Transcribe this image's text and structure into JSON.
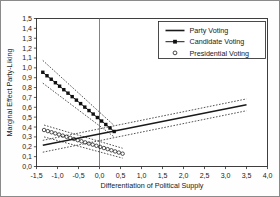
{
  "figure": {
    "caption_fragment": "",
    "frame": true
  },
  "chart_data": {
    "type": "line",
    "title": "",
    "xlabel": "Differentiation of Political Supply",
    "ylabel": "Marginal Effect Party-Liking",
    "xlim": [
      -1.5,
      4.0
    ],
    "ylim": [
      0.0,
      1.5
    ],
    "xticks": [
      -1.5,
      -1.0,
      -0.5,
      0.0,
      0.5,
      1.0,
      1.5,
      2.0,
      2.5,
      3.0,
      3.5,
      4.0
    ],
    "xtick_labels": [
      "-1,5",
      "-1,0",
      "-0,5",
      "0,0",
      "0,5",
      "1,0",
      "1,5",
      "2,0",
      "2,5",
      "3,0",
      "3,5",
      "4,0"
    ],
    "yticks": [
      0.0,
      0.1,
      0.2,
      0.3,
      0.4,
      0.5,
      0.6,
      0.7,
      0.8,
      0.9,
      1.0,
      1.1,
      1.2,
      1.3,
      1.4,
      1.5
    ],
    "ytick_labels": [
      "0,0",
      "0,1",
      "0,2",
      "0,3",
      "0,4",
      "0,5",
      "0,6",
      "0,7",
      "0,8",
      "0,9",
      "1,0",
      "1,1",
      "1,2",
      "1,3",
      "1,4",
      "1,5"
    ],
    "decimal_separator": ",",
    "grid": false,
    "reference_line_x": 0.0,
    "legend_position": "top-right",
    "series": [
      {
        "name": "Party Voting",
        "style": "solid-line",
        "color": "#1a1a1a",
        "x": [
          -1.35,
          3.5
        ],
        "values": [
          0.215,
          0.625
        ],
        "ci_upper": [
          0.265,
          0.685
        ],
        "ci_lower": [
          0.145,
          0.565
        ]
      },
      {
        "name": "Candidate Voting",
        "style": "line-with-square-markers",
        "color": "#1a1a1a",
        "x": [
          -1.35,
          0.35
        ],
        "values": [
          0.955,
          0.355
        ],
        "ci_upper": [
          1.075,
          0.415
        ],
        "ci_lower": [
          0.845,
          0.3
        ],
        "marker_count": 18
      },
      {
        "name": "Presidential Voting",
        "style": "open-circle-markers",
        "color": "#1a1a1a",
        "x": [
          -1.32,
          0.55
        ],
        "values": [
          0.37,
          0.13
        ],
        "ci_upper": [
          0.42,
          0.185
        ],
        "ci_lower": [
          0.3,
          0.085
        ],
        "marker_count": 22
      }
    ]
  },
  "legend": {
    "items": [
      {
        "label": "Party Voting",
        "marker": "solid-line"
      },
      {
        "label": "Candidate Voting",
        "marker": "line-square-marker"
      },
      {
        "label": "Presidential Voting",
        "marker": "open-circle"
      }
    ]
  }
}
